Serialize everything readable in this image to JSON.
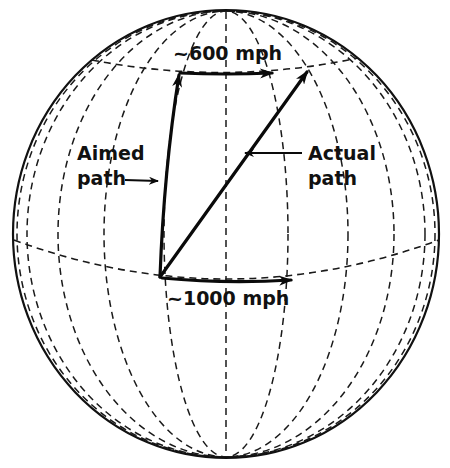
{
  "diagram": {
    "type": "globe-coriolis-illustration",
    "labels": {
      "top_speed": "~600 mph",
      "bottom_speed": "~1000 mph",
      "aimed_line1": "Aimed",
      "aimed_line2": "path",
      "actual_line1": "Actual",
      "actual_line2": "path"
    },
    "elements": [
      {
        "name": "globe-outline",
        "style": "solid"
      },
      {
        "name": "meridians",
        "style": "dashed",
        "count": 11
      },
      {
        "name": "equator-parallel",
        "style": "dashed"
      },
      {
        "name": "upper-parallel",
        "style": "dashed"
      },
      {
        "name": "aimed-path-arrow",
        "from": "equator point",
        "to": "upper parallel (due north)"
      },
      {
        "name": "actual-path-arrow",
        "from": "equator point",
        "to": "upper parallel (deflected east)"
      },
      {
        "name": "top-velocity-arrow",
        "label": "~600 mph"
      },
      {
        "name": "bottom-velocity-arrow",
        "label": "~1000 mph"
      }
    ],
    "colors": {
      "ink": "#111111",
      "background": "#ffffff"
    }
  }
}
